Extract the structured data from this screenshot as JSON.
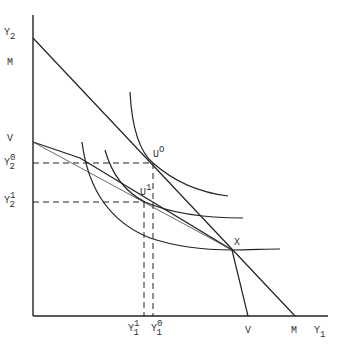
{
  "diagram": {
    "type": "economics indifference-curve / production-possibility diagram",
    "axes": {
      "x_label": {
        "main": "Y",
        "sub": "1"
      },
      "y_label": {
        "main": "Y",
        "sub": "2"
      }
    },
    "y_axis_ticks": [
      {
        "id": "M",
        "text": "M"
      },
      {
        "id": "V",
        "text": "V"
      },
      {
        "id": "Y2_0",
        "main": "Y",
        "sup": "0",
        "sub": "2"
      },
      {
        "id": "Y2_1",
        "main": "Y",
        "sup": "1",
        "sub": "2"
      }
    ],
    "x_axis_ticks": [
      {
        "id": "Y1_1",
        "main": "Y",
        "sup": "1",
        "sub": "1"
      },
      {
        "id": "Y1_0",
        "main": "Y",
        "sup": "0",
        "sub": "1"
      },
      {
        "id": "V",
        "text": "V"
      },
      {
        "id": "M",
        "text": "M"
      }
    ],
    "points": [
      {
        "id": "U0",
        "main": "U",
        "sup": "O"
      },
      {
        "id": "U1",
        "main": "U",
        "sup": "1"
      },
      {
        "id": "X",
        "text": "X"
      }
    ],
    "lines": [
      {
        "id": "budget-line-M",
        "from": "Y2 intercept",
        "to": "M on Y1 axis"
      },
      {
        "id": "budget-line-V",
        "from": "V on Y2 axis",
        "through": "U1",
        "to": "X"
      },
      {
        "id": "kinked-line-V",
        "from": "V on Y2 axis",
        "to": "X",
        "then": "V on Y1 axis"
      }
    ],
    "curves": [
      {
        "id": "indifference-curve-U0",
        "tangent_at": "U0"
      },
      {
        "id": "indifference-curve-U1",
        "tangent_at": "U1"
      },
      {
        "id": "indifference-curve-X",
        "through": "X"
      }
    ]
  }
}
